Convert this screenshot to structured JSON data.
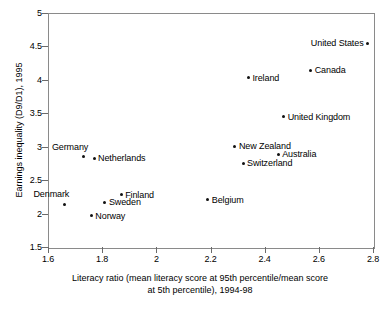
{
  "chart_data": {
    "type": "scatter",
    "title": "",
    "xlabel": "Literacy ratio (mean literacy score at 95th percentile/mean score at 5th percentile), 1994-98",
    "xlabel_line1": "Literacy ratio (mean literacy score at 95th percentile/mean score",
    "xlabel_line2": "at 5th percentile), 1994-98",
    "ylabel": "Earnings inequality (D9/D1), 1995",
    "xlim": [
      1.6,
      2.8
    ],
    "ylim": [
      1.5,
      5
    ],
    "xticks": [
      "1.6",
      "1.8",
      "2",
      "2.2",
      "2.4",
      "2.6",
      "2.8"
    ],
    "xtick_values": [
      1.6,
      1.8,
      2.0,
      2.2,
      2.4,
      2.6,
      2.8
    ],
    "yticks": [
      "5",
      "4.5",
      "4",
      "3.5",
      "3",
      "2.5",
      "2",
      "1.5"
    ],
    "ytick_values": [
      5,
      4.5,
      4,
      3.5,
      3,
      2.5,
      2,
      1.5
    ],
    "grid": false,
    "legend": "none",
    "marker": "filled-circle",
    "marker_color": "#111111",
    "points": [
      {
        "label": "United States",
        "x": 2.78,
        "y": 4.55,
        "label_side": "left"
      },
      {
        "label": "Canada",
        "x": 2.57,
        "y": 4.14,
        "label_side": "right"
      },
      {
        "label": "Ireland",
        "x": 2.34,
        "y": 4.03,
        "label_side": "right"
      },
      {
        "label": "United Kingdom",
        "x": 2.47,
        "y": 3.45,
        "label_side": "right"
      },
      {
        "label": "New Zealand",
        "x": 2.29,
        "y": 3.01,
        "label_side": "right"
      },
      {
        "label": "Australia",
        "x": 2.45,
        "y": 2.89,
        "label_side": "right"
      },
      {
        "label": "Switzerland",
        "x": 2.32,
        "y": 2.75,
        "label_side": "right"
      },
      {
        "label": "Germany",
        "x": 1.73,
        "y": 2.85,
        "label_side": "above-left"
      },
      {
        "label": "Netherlands",
        "x": 1.77,
        "y": 2.83,
        "label_side": "right"
      },
      {
        "label": "Finland",
        "x": 1.87,
        "y": 2.28,
        "label_side": "right"
      },
      {
        "label": "Sweden",
        "x": 1.81,
        "y": 2.17,
        "label_side": "right"
      },
      {
        "label": "Denmark",
        "x": 1.66,
        "y": 2.14,
        "label_side": "above-left"
      },
      {
        "label": "Norway",
        "x": 1.76,
        "y": 1.97,
        "label_side": "right"
      },
      {
        "label": "Belgium",
        "x": 2.19,
        "y": 2.21,
        "label_side": "right"
      }
    ]
  }
}
